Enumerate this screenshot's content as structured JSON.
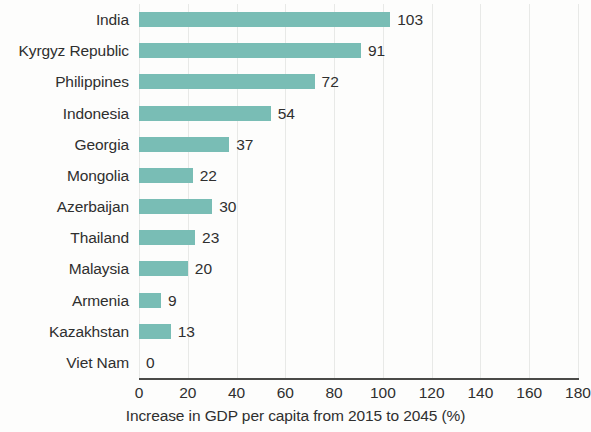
{
  "chart_data": {
    "type": "bar",
    "orientation": "horizontal",
    "title": "",
    "subtitle": "",
    "xlabel": "Increase in GDP per capita from 2015 to 2045 (%)",
    "ylabel": "",
    "xlim": [
      0,
      180
    ],
    "xticks": [
      0,
      20,
      40,
      60,
      80,
      100,
      120,
      140,
      160,
      180
    ],
    "xtick_labels": [
      "0",
      "20",
      "40",
      "60",
      "80",
      "100",
      "120",
      "140",
      "160",
      "180"
    ],
    "grid": "vertical",
    "legend": "none",
    "bar_color": "#79bdb5",
    "text_color": "#2f2f2f",
    "axis_color": "#4a4a48",
    "gridline_color": "#e8e9e7",
    "background_color": "#fdfdfc",
    "categories": [
      "India",
      "Kyrgyz Republic",
      "Philippines",
      "Indonesia",
      "Georgia",
      "Mongolia",
      "Azerbaijan",
      "Thailand",
      "Malaysia",
      "Armenia",
      "Kazakhstan",
      "Viet Nam"
    ],
    "values": [
      103,
      91,
      72,
      54,
      37,
      22,
      30,
      23,
      20,
      9,
      13,
      0
    ],
    "value_labels": [
      "103",
      "91",
      "72",
      "54",
      "37",
      "22",
      "30",
      "23",
      "20",
      "9",
      "13",
      "0"
    ],
    "bars": [
      {
        "category": "India",
        "value": 103,
        "label": "103"
      },
      {
        "category": "Kyrgyz Republic",
        "value": 91,
        "label": "91"
      },
      {
        "category": "Philippines",
        "value": 72,
        "label": "72"
      },
      {
        "category": "Indonesia",
        "value": 54,
        "label": "54"
      },
      {
        "category": "Georgia",
        "value": 37,
        "label": "37"
      },
      {
        "category": "Mongolia",
        "value": 22,
        "label": "22"
      },
      {
        "category": "Azerbaijan",
        "value": 30,
        "label": "30"
      },
      {
        "category": "Thailand",
        "value": 23,
        "label": "23"
      },
      {
        "category": "Malaysia",
        "value": 20,
        "label": "20"
      },
      {
        "category": "Armenia",
        "value": 9,
        "label": "9"
      },
      {
        "category": "Kazakhstan",
        "value": 13,
        "label": "13"
      },
      {
        "category": "Viet Nam",
        "value": 0,
        "label": "0"
      }
    ]
  }
}
